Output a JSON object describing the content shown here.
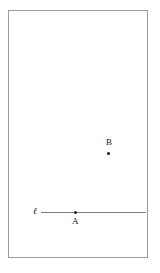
{
  "figure": {
    "type": "geometry-diagram",
    "frame": {
      "border_color": "#9b9b9b",
      "background_color": "#ffffff"
    },
    "line": {
      "label": "ℓ",
      "color": "#808080",
      "orientation": "horizontal",
      "x_start": 32,
      "x_end": 137,
      "y": 201
    },
    "points": [
      {
        "label": "A",
        "x": 66,
        "y": 201,
        "on_line": true,
        "color": "#1a1a1a",
        "label_position": "below"
      },
      {
        "label": "B",
        "x": 99,
        "y": 142,
        "on_line": false,
        "color": "#1a1a1a",
        "label_position": "above"
      }
    ]
  }
}
